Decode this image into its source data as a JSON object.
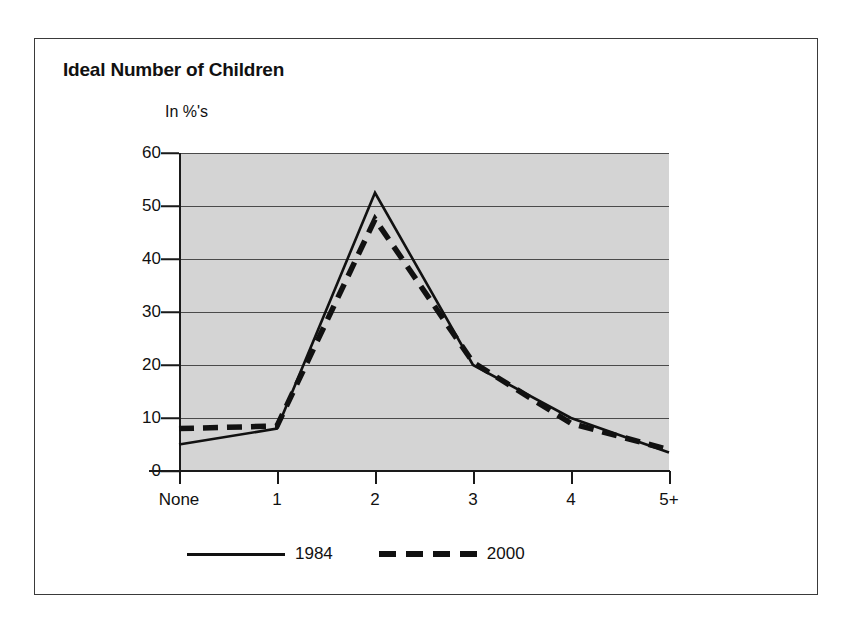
{
  "chart_data": {
    "type": "line",
    "title": "Ideal Number of Children",
    "ylabel": "In %'s",
    "xlabel": "",
    "categories": [
      "None",
      "1",
      "2",
      "3",
      "4",
      "5+"
    ],
    "series": [
      {
        "name": "1984",
        "style": "solid",
        "values": [
          5,
          8,
          52.5,
          20,
          10,
          3.5
        ]
      },
      {
        "name": "2000",
        "style": "dashed",
        "values": [
          8,
          8.5,
          47.5,
          20.5,
          9,
          4
        ]
      }
    ],
    "ylim": [
      0,
      60
    ],
    "yticks": [
      0,
      10,
      20,
      30,
      40,
      50,
      60
    ],
    "ytick_labels": [
      "0",
      "10",
      "20",
      "30",
      "40",
      "50",
      "60"
    ],
    "grid": true,
    "legend_position": "bottom",
    "plot_background": "#d4d4d4",
    "line_color": "#111111"
  },
  "figure": {
    "title": "Ideal Number of Children",
    "axis_note": "In %'s"
  }
}
